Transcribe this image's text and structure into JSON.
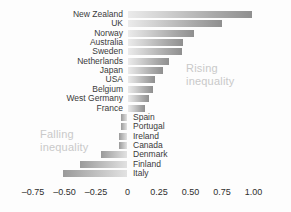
{
  "chart_data": {
    "type": "bar",
    "orientation": "horizontal",
    "title": "",
    "subtitle": "",
    "xlabel": "",
    "ylabel": "",
    "xlim": [
      -0.85,
      1.08
    ],
    "grid": false,
    "legend": "none",
    "xticks": [
      {
        "value": -0.75,
        "label": "–0.75"
      },
      {
        "value": -0.5,
        "label": "–0.50"
      },
      {
        "value": -0.25,
        "label": "–0.25"
      },
      {
        "value": 0,
        "label": "0"
      },
      {
        "value": 0.25,
        "label": "0.25"
      },
      {
        "value": 0.5,
        "label": "0.50"
      },
      {
        "value": 0.75,
        "label": "0.75"
      },
      {
        "value": 1.0,
        "label": "1.00"
      }
    ],
    "categories": [
      "New Zealand",
      "UK",
      "Norway",
      "Australia",
      "Sweden",
      "Netherlands",
      "Japan",
      "USA",
      "Belgium",
      "West Germany",
      "France",
      "Spain",
      "Portugal",
      "Ireland",
      "Canada",
      "Denmark",
      "Finland",
      "Italy"
    ],
    "values": [
      0.99,
      0.75,
      0.53,
      0.44,
      0.43,
      0.33,
      0.28,
      0.22,
      0.2,
      0.17,
      0.14,
      -0.05,
      -0.05,
      -0.07,
      -0.07,
      -0.21,
      -0.38,
      -0.51
    ],
    "annotations": [
      {
        "id": "rising",
        "text": "Rising\ninequality",
        "color": "#c9c9c9"
      },
      {
        "id": "falling",
        "text": "Falling\ninequality",
        "color": "#c9c9c9"
      }
    ]
  },
  "colors": {
    "background": "#fdfdfd",
    "bar_light": "#e6e6e6",
    "bar_dark": "#8f8f8f",
    "label_text": "#3a3a3a",
    "annotation_text": "#c9c9c9",
    "tick_text": "#2e2e2e"
  }
}
